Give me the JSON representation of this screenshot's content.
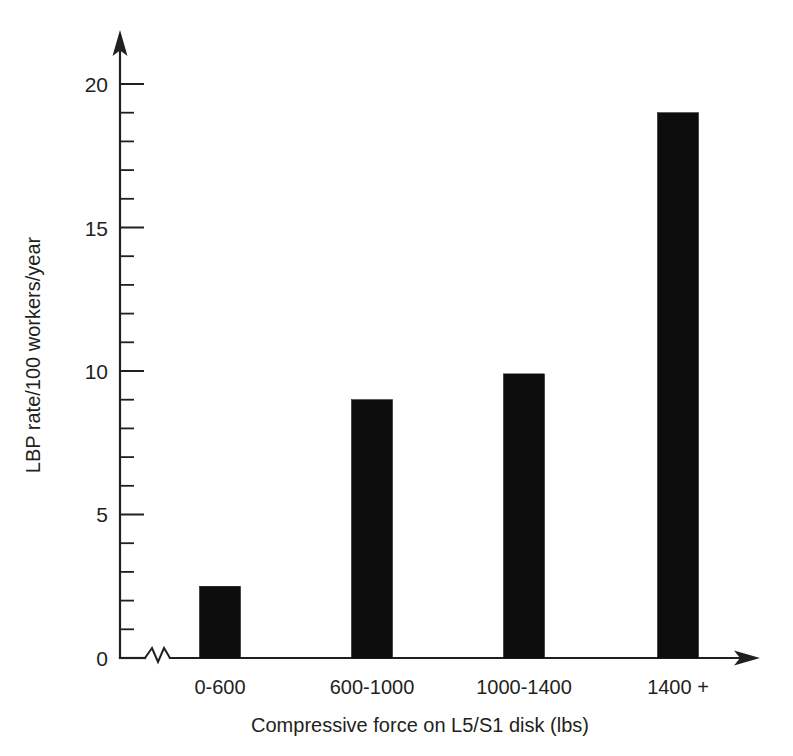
{
  "chart_data": {
    "type": "bar",
    "title": "",
    "subtitle": "",
    "categories": [
      "0-600",
      "600-1000",
      "1000-1400",
      "1400 +"
    ],
    "values": [
      2.5,
      9.0,
      9.9,
      19.0
    ],
    "xlabel": "Compressive force on L5/S1 disk (lbs)",
    "ylabel": "LBP rate/100 workers/year",
    "ylim": [
      0,
      20
    ],
    "xlim_note": "categorical",
    "y_ticks_major": [
      0,
      5,
      10,
      15,
      20
    ],
    "y_tick_labels": [
      "0",
      "5",
      "10",
      "15",
      "20"
    ],
    "y_tick_minor_step": 1,
    "grid": false,
    "legend": null,
    "annotations": [
      {
        "name": "x-axis-break",
        "text": "axis break zigzag near origin"
      }
    ],
    "bar_color": "#0d0d0d",
    "axis_color": "#231f20",
    "background_color": "#ffffff"
  },
  "axes": {
    "y_label": "LBP rate/100 workers/year",
    "x_label": "Compressive force on L5/S1 disk (lbs)",
    "y_tick_labels": {
      "t0": "0",
      "t5": "5",
      "t10": "10",
      "t15": "15",
      "t20": "20"
    },
    "x_tick_labels": {
      "c0": "0-600",
      "c1": "600-1000",
      "c2": "1000-1400",
      "c3": "1400 +"
    }
  }
}
